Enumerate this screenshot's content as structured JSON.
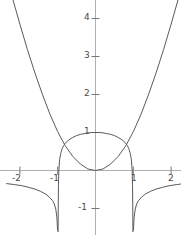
{
  "chart_data": {
    "type": "line",
    "title": "",
    "xlabel": "",
    "ylabel": "",
    "xlim": [
      -2.5,
      2.3
    ],
    "ylim": [
      -1.6,
      4.55
    ],
    "grid": false,
    "legend": null,
    "axes": {
      "x_ticks": [
        -2,
        -1,
        1,
        2
      ],
      "x_tick_labels": [
        "-2",
        "-1",
        "1",
        "2"
      ],
      "y_ticks": [
        1,
        2,
        3,
        4,
        -1
      ],
      "y_tick_labels": [
        "1",
        "2",
        "3",
        "4",
        "-1"
      ],
      "axis_color": "#b0b0b0",
      "tick_color": "#777777",
      "label_color": "#4a4a4a"
    },
    "curve_color": "#5a5a5a",
    "curve_width": 1,
    "asymptotes": [
      -1,
      1
    ],
    "series": [
      {
        "name": "dome-branch",
        "description": "central dome peaking at (0,1) with vertical asymptotes at x=-1 and x=1",
        "points": [
          [
            -0.99,
            -1.6
          ],
          [
            -0.985,
            -0.9
          ],
          [
            -0.98,
            -0.4
          ],
          [
            -0.97,
            0.0
          ],
          [
            -0.95,
            0.28
          ],
          [
            -0.92,
            0.45
          ],
          [
            -0.88,
            0.58
          ],
          [
            -0.84,
            0.66
          ],
          [
            -0.78,
            0.74
          ],
          [
            -0.7,
            0.81
          ],
          [
            -0.6,
            0.87
          ],
          [
            -0.5,
            0.92
          ],
          [
            -0.4,
            0.95
          ],
          [
            -0.3,
            0.97
          ],
          [
            -0.2,
            0.99
          ],
          [
            -0.1,
            1.0
          ],
          [
            0.0,
            1.0
          ],
          [
            0.1,
            1.0
          ],
          [
            0.2,
            0.99
          ],
          [
            0.3,
            0.97
          ],
          [
            0.4,
            0.95
          ],
          [
            0.5,
            0.92
          ],
          [
            0.6,
            0.87
          ],
          [
            0.7,
            0.81
          ],
          [
            0.78,
            0.74
          ],
          [
            0.84,
            0.66
          ],
          [
            0.88,
            0.58
          ],
          [
            0.92,
            0.45
          ],
          [
            0.95,
            0.28
          ],
          [
            0.97,
            0.0
          ],
          [
            0.98,
            -0.4
          ],
          [
            0.985,
            -0.9
          ],
          [
            0.99,
            -1.6
          ]
        ]
      },
      {
        "name": "parabola-branch",
        "description": "upward opening curve through origin rising to y=4.5 at x=+/-2.2",
        "points": [
          [
            -2.2,
            4.55
          ],
          [
            -2.0,
            3.85
          ],
          [
            -1.8,
            3.18
          ],
          [
            -1.6,
            2.56
          ],
          [
            -1.4,
            1.99
          ],
          [
            -1.2,
            1.47
          ],
          [
            -1.0,
            1.02
          ],
          [
            -0.8,
            0.65
          ],
          [
            -0.6,
            0.37
          ],
          [
            -0.4,
            0.17
          ],
          [
            -0.2,
            0.04
          ],
          [
            0.0,
            0.0
          ],
          [
            0.2,
            0.04
          ],
          [
            0.4,
            0.17
          ],
          [
            0.6,
            0.37
          ],
          [
            0.8,
            0.65
          ],
          [
            1.0,
            1.02
          ],
          [
            1.2,
            1.47
          ],
          [
            1.4,
            1.99
          ],
          [
            1.6,
            2.56
          ],
          [
            1.8,
            3.18
          ],
          [
            2.0,
            3.85
          ],
          [
            2.2,
            4.55
          ]
        ]
      },
      {
        "name": "lower-left-branch",
        "description": "lower branch left of x=-1 asymptote, falling away to the left",
        "points": [
          [
            -0.99,
            -1.6
          ],
          [
            -1.005,
            -1.55
          ],
          [
            -1.02,
            -1.25
          ],
          [
            -1.05,
            -1.02
          ],
          [
            -1.09,
            -0.88
          ],
          [
            -1.14,
            -0.79
          ],
          [
            -1.22,
            -0.7
          ],
          [
            -1.32,
            -0.62
          ],
          [
            -1.45,
            -0.55
          ],
          [
            -1.6,
            -0.49
          ],
          [
            -1.78,
            -0.44
          ],
          [
            -1.95,
            -0.4
          ],
          [
            -2.15,
            -0.37
          ],
          [
            -2.35,
            -0.345
          ]
        ]
      },
      {
        "name": "lower-right-branch",
        "description": "lower branch right of x=1 asymptote, falling away to the right",
        "points": [
          [
            0.99,
            -1.6
          ],
          [
            1.005,
            -1.55
          ],
          [
            1.02,
            -1.25
          ],
          [
            1.05,
            -1.02
          ],
          [
            1.09,
            -0.88
          ],
          [
            1.14,
            -0.79
          ],
          [
            1.22,
            -0.7
          ],
          [
            1.32,
            -0.62
          ],
          [
            1.45,
            -0.55
          ],
          [
            1.6,
            -0.49
          ],
          [
            1.78,
            -0.44
          ],
          [
            1.95,
            -0.4
          ],
          [
            2.15,
            -0.37
          ],
          [
            2.35,
            -0.345
          ]
        ]
      }
    ]
  },
  "tick_labels": {
    "y4": "4",
    "y3": "3",
    "y2": "2",
    "y1": "1",
    "ym1": "-1",
    "xm2": "-2",
    "xm1": "-1",
    "x1": "1",
    "x2": "2"
  }
}
